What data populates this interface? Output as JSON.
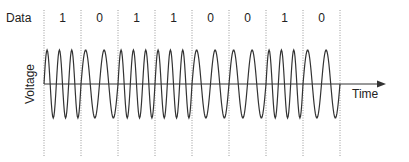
{
  "diagram": {
    "data_label": "Data",
    "y_axis_label": "Voltage",
    "x_axis_label": "Time",
    "bits": [
      "1",
      "0",
      "1",
      "1",
      "0",
      "0",
      "1",
      "0"
    ],
    "cycles_per_bit": {
      "1": 3,
      "0": 2
    },
    "colors": {
      "wave": "#333333",
      "axis": "#333333",
      "divider": "#9a9a9a"
    }
  }
}
